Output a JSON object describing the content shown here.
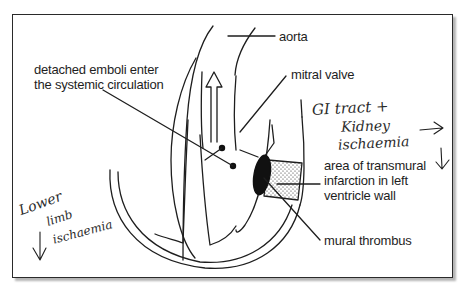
{
  "diagram": {
    "labels": {
      "aorta": "aorta",
      "mitral_valve": "mitral valve",
      "emboli_line1": "detached emboli enter",
      "emboli_line2": "the systemic circulation",
      "infarction_line1": "area of transmural",
      "infarction_line2": "infarction in left",
      "infarction_line3": "ventricle wall",
      "thrombus": "mural thrombus"
    },
    "handwritten": {
      "gi_line1": "GI tract +",
      "gi_line2": "Kidney",
      "gi_line3": "ischaemia",
      "limb_line1": "Lower",
      "limb_line2": "limb",
      "limb_line3": "ischaemia"
    },
    "colors": {
      "ink": "#1e1e1e",
      "frame_shadow": "#b5b5b5",
      "background": "#ffffff"
    }
  }
}
